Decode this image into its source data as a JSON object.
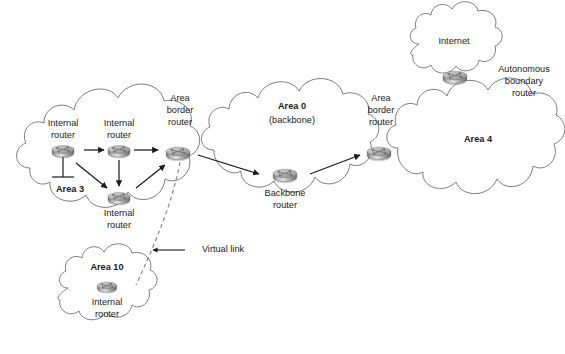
{
  "diagram": {
    "type": "network-topology",
    "background_color": "#ffffff",
    "line_color": "#1c1c1c",
    "cloud_stroke_color": "#6e6e6e",
    "virtual_link_color": "#8a8a8a"
  },
  "clouds": [
    {
      "id": "area3",
      "label": "Area 3",
      "bold": true,
      "sublabel": ""
    },
    {
      "id": "area0",
      "label": "Area 0",
      "bold": true,
      "sublabel": "(backbone)"
    },
    {
      "id": "area4",
      "label": "Area 4",
      "bold": true,
      "sublabel": ""
    },
    {
      "id": "area10",
      "label": "Area 10",
      "bold": true,
      "sublabel": ""
    },
    {
      "id": "internet",
      "label": "Internet",
      "bold": false,
      "sublabel": ""
    }
  ],
  "routers": [
    {
      "id": "internal-router-1",
      "icon": "router-icon",
      "label_lines": [
        "Internal",
        "router"
      ],
      "label_position": "above"
    },
    {
      "id": "internal-router-2",
      "icon": "router-icon",
      "label_lines": [
        "Internal",
        "router"
      ],
      "label_position": "above"
    },
    {
      "id": "internal-router-3",
      "icon": "router-icon",
      "label_lines": [
        "Internal",
        "router"
      ],
      "label_position": "below"
    },
    {
      "id": "area-border-router-left",
      "icon": "router-icon",
      "label_lines": [
        "Area",
        "border",
        "router"
      ],
      "label_position": "above"
    },
    {
      "id": "backbone-router",
      "icon": "router-icon",
      "label_lines": [
        "Backbone",
        "router"
      ],
      "label_position": "below"
    },
    {
      "id": "area-border-router-right",
      "icon": "router-icon",
      "label_lines": [
        "Area",
        "border",
        "router"
      ],
      "label_position": "above"
    },
    {
      "id": "autonomous-boundary-router",
      "icon": "router-icon",
      "label_lines": [
        "Autonomous",
        "boundary",
        "router"
      ],
      "label_position": "right"
    },
    {
      "id": "internal-router-area10",
      "icon": "router-icon",
      "label_lines": [
        "Internal",
        "router"
      ],
      "label_position": "below"
    }
  ],
  "annotations": [
    {
      "id": "virtual-link",
      "text": "Virtual link",
      "has_leader_arrow": true
    }
  ],
  "connections": [
    {
      "from": "internal-router-1",
      "to": "internal-router-2",
      "style": "arrow"
    },
    {
      "from": "internal-router-2",
      "to": "area-border-router-left",
      "style": "arrow"
    },
    {
      "from": "internal-router-1",
      "to": "internal-router-3",
      "style": "arrow"
    },
    {
      "from": "internal-router-2",
      "to": "internal-router-3",
      "style": "arrow"
    },
    {
      "from": "internal-router-3",
      "to": "area-border-router-left",
      "style": "arrow"
    },
    {
      "from": "area-border-router-left",
      "to": "backbone-router",
      "style": "arrow"
    },
    {
      "from": "backbone-router",
      "to": "area-border-router-right",
      "style": "arrow"
    },
    {
      "from": "area-border-router-left",
      "to": "internal-router-area10",
      "style": "dashed"
    },
    {
      "from": "internal-router-1",
      "to": "lan-segment",
      "style": "stub"
    }
  ]
}
